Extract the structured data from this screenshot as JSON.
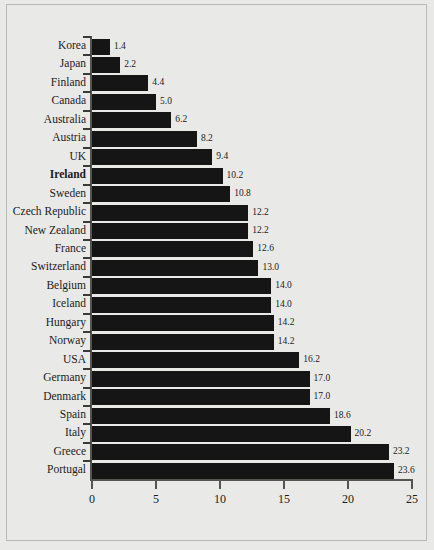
{
  "chart_data": {
    "type": "bar",
    "orientation": "horizontal",
    "title": "",
    "subtitle": "",
    "xlabel": "",
    "ylabel": "",
    "xlim": [
      0,
      25
    ],
    "xticks": [
      0,
      5,
      10,
      15,
      20,
      25
    ],
    "xtick_labels": [
      "0",
      "5",
      "10",
      "15",
      "20",
      "25"
    ],
    "grid": false,
    "legend": null,
    "bar_color": "#151515",
    "background_color": "#e9e9e7",
    "highlight_category": "Ireland",
    "categories": [
      "Korea",
      "Japan",
      "Finland",
      "Canada",
      "Australia",
      "Austria",
      "UK",
      "Ireland",
      "Sweden",
      "Czech Republic",
      "New Zealand",
      "France",
      "Switzerland",
      "Belgium",
      "Iceland",
      "Hungary",
      "Norway",
      "USA",
      "Germany",
      "Denmark",
      "Spain",
      "Italy",
      "Greece",
      "Portugal"
    ],
    "values": [
      1.4,
      2.2,
      4.4,
      5.0,
      6.2,
      8.2,
      9.4,
      10.2,
      10.8,
      12.2,
      12.2,
      12.6,
      13.0,
      14.0,
      14.0,
      14.2,
      14.2,
      16.2,
      17.0,
      17.0,
      18.6,
      20.2,
      23.2,
      23.6
    ],
    "value_labels": [
      "1.4",
      "2.2",
      "4.4",
      "5.0",
      "6.2",
      "8.2",
      "9.4",
      "10.2",
      "10.8",
      "12.2",
      "12.2",
      "12.6",
      "13.0",
      "14.0",
      "14.0",
      "14.2",
      "14.2",
      "16.2",
      "17.0",
      "17.0",
      "18.6",
      "20.2",
      "23.2",
      "23.6"
    ]
  }
}
